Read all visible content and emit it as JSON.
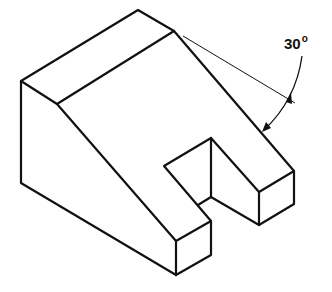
{
  "figure": {
    "type": "isometric technical drawing",
    "angle_label": "30",
    "angle_unit_symbol": "o",
    "line_color": "#111111",
    "background": "#ffffff"
  }
}
